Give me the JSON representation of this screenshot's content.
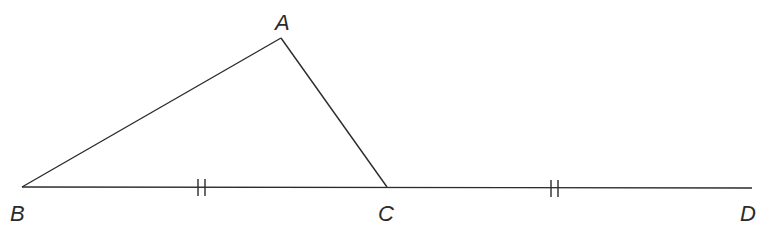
{
  "diagram": {
    "type": "geometry",
    "points": {
      "A": {
        "label": "A",
        "x": 281,
        "y": 38
      },
      "B": {
        "label": "B",
        "x": 22,
        "y": 187
      },
      "C": {
        "label": "C",
        "x": 387,
        "y": 187
      },
      "D": {
        "label": "D",
        "x": 752,
        "y": 188
      }
    },
    "segments": [
      {
        "from": "B",
        "to": "A"
      },
      {
        "from": "A",
        "to": "C"
      },
      {
        "from": "B",
        "to": "C"
      },
      {
        "from": "C",
        "to": "D"
      }
    ],
    "congruence_marks": [
      {
        "segment": "BC",
        "ticks": 2
      },
      {
        "segment": "CD",
        "ticks": 2
      }
    ],
    "line_color": "#2b2b2b"
  }
}
